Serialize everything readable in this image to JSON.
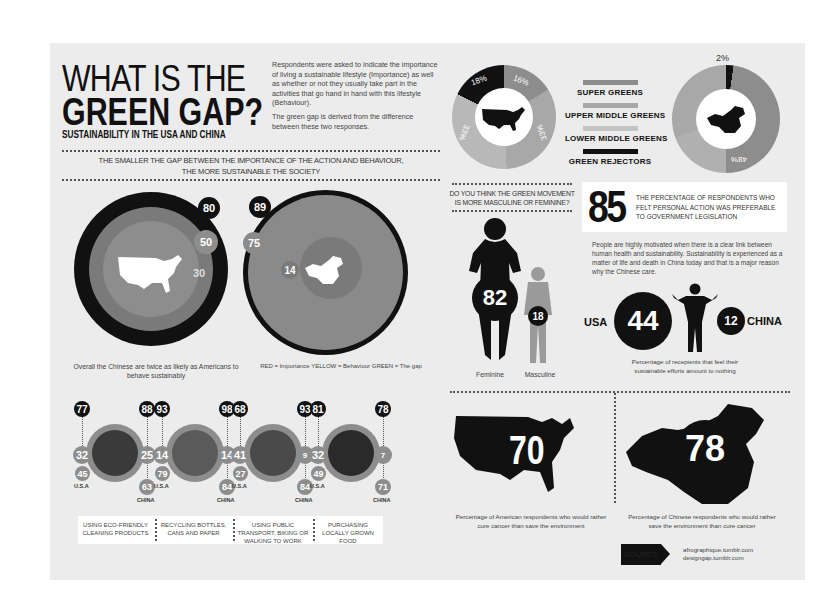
{
  "header": {
    "title_line1": "WHAT IS THE",
    "title_line2": "GREEN GAP?",
    "subtitle": "SUSTAINABILITY IN THE USA AND CHINA",
    "intro_p1": "Respondents were asked to indicate the importance of living a sustainable lifestyle (Importance) as well as whether or not they usually take part in the activities that go hand in hand with this lifestyle (Behaviour).",
    "intro_p2": "The green gap is derived from the difference between these two responses."
  },
  "banner": {
    "line1": "THE SMALLER THE GAP BETWEEN THE IMPORTANCE OF THE ACTION AND BEHAVIOUR,",
    "line2": "THE MORE SUSTAINABLE THE SOCIETY"
  },
  "gap_circles": {
    "usa": {
      "importance": "80",
      "behaviour": "50",
      "gap": "30"
    },
    "china": {
      "importance": "89",
      "behaviour": "75",
      "gap": "14"
    },
    "caption_left": "Overall the Chinese are twice as likely as Americans to behave sustainably",
    "caption_right": "RED = Importance  YELLOW = Behaviour  GREEN = The gap"
  },
  "activities": [
    {
      "label": "USING ECO-FRIENDLY CLEANING PRODUCTS",
      "usa_imp": "77",
      "usa_gap": "32",
      "usa_beh": "45",
      "china_imp": "88",
      "china_gap": "25",
      "china_beh": "63"
    },
    {
      "label": "RECYCLING BOTTLES, CANS AND PAPER",
      "usa_imp": "93",
      "usa_gap": "14",
      "usa_beh": "79",
      "china_imp": "98",
      "china_gap": "14",
      "china_beh": "84"
    },
    {
      "label": "USING PUBLIC TRANSPORT, BIKING OR WALKING TO WORK",
      "usa_imp": "68",
      "usa_gap": "41",
      "usa_beh": "27",
      "china_imp": "93",
      "china_gap": "9",
      "china_beh": "84"
    },
    {
      "label": "PURCHASING LOCALLY GROWN FOOD",
      "usa_imp": "81",
      "usa_gap": "32",
      "usa_beh": "49",
      "china_imp": "78",
      "china_gap": "7",
      "china_beh": "71"
    }
  ],
  "country_labels": {
    "usa": "U.S.A",
    "china": "CHINA"
  },
  "segments": {
    "usa": [
      {
        "name": "Green Rejectors",
        "value": "18%"
      },
      {
        "name": "Super Greens",
        "value": "16%"
      },
      {
        "name": "Upper Middle Greens",
        "value": "33%"
      },
      {
        "name": "Lower Middle Greens",
        "value": "33%"
      }
    ],
    "china": [
      {
        "name": "Green Rejectors",
        "value": "2%"
      },
      {
        "name": "Super Greens",
        "value": "48%"
      }
    ],
    "legend": [
      "SUPER GREENS",
      "UPPER MIDDLE GREENS",
      "LOWER MIDDLE GREENS",
      "GREEN REJECTORS"
    ]
  },
  "gender": {
    "question": "DO YOU THINK THE GREEN MOVEMENT IS MORE MASCULINE OR FEMININE?",
    "feminine_value": "82",
    "masculine_value": "18",
    "feminine_label": "Feminine",
    "masculine_label": "Masculine"
  },
  "personal_action": {
    "value": "85",
    "text": "THE PERCENTAGE OF RESPONDENTS WHO FELT PERSONAL ACTION WAS PREFERABLE TO GOVERNMENT LEGISLATION",
    "body": "People are highly motivated when there is a clear link between human health and sustainability. Sustainability is experienced as a matter of life and death in China today and that is a major reason why the Chinese care."
  },
  "nothing": {
    "usa_label": "USA",
    "usa_value": "44",
    "china_label": "CHINA",
    "china_value": "12",
    "caption": "Percentage of recepients that feel their sustainable efforts amount to nothing"
  },
  "cancer": {
    "usa_value": "70",
    "usa_caption": "Percentage of American respondents who would rather cure cancer than save the environment",
    "china_value": "78",
    "china_caption": "Percentage of Chinese respondents who would rather save the environment than cure cancer"
  },
  "source": {
    "badge": "SOURCE",
    "line1": "afrographique.tumblr.com",
    "line2": "designgap.tumblr.com"
  },
  "colors": {
    "black": "#111111",
    "dark_gray": "#6e6e6e",
    "mid_gray": "#8c8c8c",
    "light_gray": "#b4b4b4",
    "panel": "#ececec"
  }
}
